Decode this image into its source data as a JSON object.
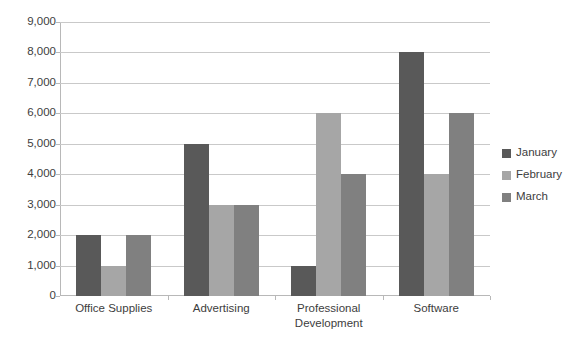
{
  "chart_data": {
    "type": "bar",
    "title": "",
    "subtitle": "",
    "xlabel": "",
    "ylabel": "",
    "categories": [
      "Office Supplies",
      "Advertising",
      "Professional Development",
      "Software"
    ],
    "series": [
      {
        "name": "January",
        "color": "#595959",
        "values": [
          2000,
          5000,
          1000,
          8000
        ]
      },
      {
        "name": "February",
        "color": "#a6a6a6",
        "values": [
          1000,
          3000,
          6000,
          4000
        ]
      },
      {
        "name": "March",
        "color": "#808080",
        "values": [
          2000,
          3000,
          4000,
          6000
        ]
      }
    ],
    "ylim": [
      0,
      9000
    ],
    "ytick_labels": [
      "9,000",
      "8,000",
      "7,000",
      "6,000",
      "5,000",
      "4,000",
      "3,000",
      "2,000",
      "1,000",
      "0"
    ],
    "ytick_values": [
      9000,
      8000,
      7000,
      6000,
      5000,
      4000,
      3000,
      2000,
      1000,
      0
    ],
    "grid": true,
    "legend_position": "right",
    "background_color": "#ffffff",
    "gridline_color": "#c9c9c9",
    "axis_color": "#b8b8b8"
  }
}
